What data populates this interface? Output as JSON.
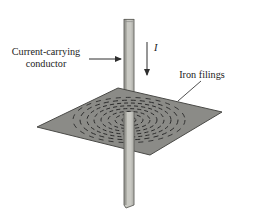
{
  "figure": {
    "background_color": "#ffffff",
    "width": 256,
    "height": 220
  },
  "labels": {
    "conductor_line1": "Current-carrying",
    "conductor_line2": "conductor",
    "iron_filings": "Iron filings",
    "current_symbol": "I"
  },
  "colors": {
    "sheet_fill": "#8b8b87",
    "sheet_edge": "#4a4a47",
    "rod_fill": "#c9c9c3",
    "rod_shade": "#9d9d97",
    "rod_edge": "#5d5d59",
    "ink": "#1b1b1b",
    "ring": "#2b2b2b",
    "leader": "#3c3c3c"
  },
  "annotations": {
    "conductor_arrow": {
      "from_x": 89,
      "from_y": 59,
      "to_x": 123,
      "to_y": 59,
      "direction": "right"
    },
    "current_arrow": {
      "from_x": 147,
      "from_y": 42,
      "to_x": 147,
      "to_y": 77,
      "direction": "down"
    },
    "iron_filings_leader": {
      "from_x": 201,
      "from_y": 81,
      "to_x": 178,
      "to_y": 101
    }
  },
  "geometry": {
    "sheet_corners": [
      {
        "x": 118,
        "y": 88
      },
      {
        "x": 222,
        "y": 112
      },
      {
        "x": 150,
        "y": 155
      },
      {
        "x": 37,
        "y": 127
      }
    ],
    "rod": {
      "x_left": 124,
      "x_right": 134,
      "y_top": 19,
      "y_bottom": 208
    },
    "rings": {
      "center_x": 129,
      "center_y": 120,
      "count": 8,
      "radii_x": [
        7,
        14,
        21,
        28,
        35,
        42,
        49,
        56
      ],
      "radii_y": [
        3.0,
        5.8,
        8.6,
        11.4,
        14.2,
        17.0,
        19.8,
        22.6
      ],
      "dash_pattern": "4 3",
      "style": "dashed-ellipse"
    }
  }
}
